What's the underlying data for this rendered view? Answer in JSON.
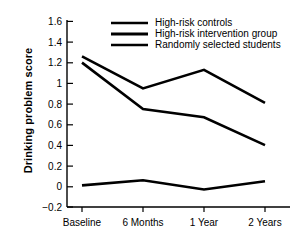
{
  "chart_data": {
    "type": "line",
    "title": "",
    "xlabel": "",
    "ylabel": "Drinking problem score",
    "categories": [
      "Baseline",
      "6 Months",
      "1 Year",
      "2 Years"
    ],
    "ylim": [
      -0.2,
      1.6
    ],
    "yticks": [
      "1.6",
      "1.4",
      "1.2",
      "1",
      "0.8",
      "0.6",
      "0.4",
      "0.2",
      "0",
      "−0.2"
    ],
    "ytick_values": [
      1.6,
      1.4,
      1.2,
      1.0,
      0.8,
      0.6,
      0.4,
      0.2,
      0,
      -0.2
    ],
    "grid": false,
    "legend_position": "top-center",
    "series": [
      {
        "name": "High-risk controls",
        "values": [
          1.26,
          0.95,
          1.13,
          0.81
        ],
        "color": "#000000",
        "style": "solid-thin"
      },
      {
        "name": "High-risk intervention group",
        "values": [
          1.2,
          0.75,
          0.67,
          0.4
        ],
        "color": "#000000",
        "style": "solid-thick"
      },
      {
        "name": "Randomly selected students",
        "values": [
          0.01,
          0.06,
          -0.03,
          0.05
        ],
        "color": "#000000",
        "style": "solid-thin"
      }
    ]
  },
  "axis": {
    "y_title": "Drinking problem score"
  }
}
